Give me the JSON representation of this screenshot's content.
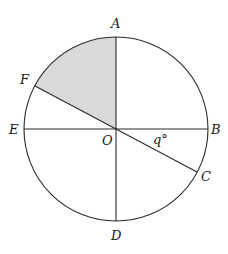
{
  "diagram": {
    "colors": {
      "line": "#2a2a2a",
      "shaded_sector": "#d9d9d9",
      "background": "#ffffff"
    },
    "circle": {
      "center_label": "O",
      "center": [
        116,
        129
      ],
      "radius": 92
    },
    "points": {
      "A": {
        "label": "A"
      },
      "B": {
        "label": "B"
      },
      "C": {
        "label": "C"
      },
      "D": {
        "label": "D"
      },
      "E": {
        "label": "E"
      },
      "F": {
        "label": "F"
      }
    },
    "segments": [
      "AD",
      "EB",
      "FC"
    ],
    "shaded_region": "sector AOF",
    "angle_label": "q°",
    "angle_between": "BOC"
  }
}
